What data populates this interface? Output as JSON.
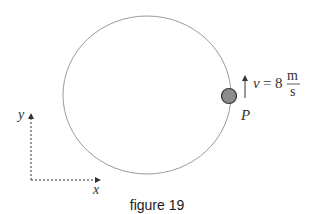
{
  "figure": {
    "caption": "figure 19",
    "velocity": {
      "symbol": "v",
      "equals": "=",
      "value": "8",
      "unit_numerator": "m",
      "unit_denominator": "s"
    },
    "point_label": "P",
    "axes": {
      "x_label": "x",
      "y_label": "y"
    },
    "colors": {
      "circle_stroke": "#9a9a9a",
      "ball_fill": "#8c8c8c",
      "ball_stroke": "#333333",
      "arrow": "#333333"
    }
  }
}
